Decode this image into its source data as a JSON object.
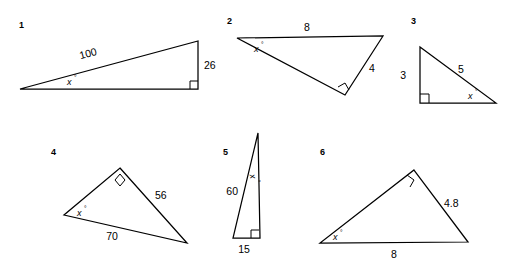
{
  "worksheet": {
    "title": "Right triangle trigonometry figures",
    "background_color": "#ffffff",
    "ink_color": "#000000"
  },
  "figures": [
    {
      "number": "1",
      "angle_label": "x",
      "degree_symbol": "°",
      "sides": [
        {
          "label": "100",
          "position": "hypotenuse"
        },
        {
          "label": "26",
          "position": "opposite-vertical"
        }
      ],
      "right_angle": true
    },
    {
      "number": "2",
      "angle_label": "x",
      "degree_symbol": "°",
      "sides": [
        {
          "label": "8",
          "position": "top"
        },
        {
          "label": "4",
          "position": "right"
        }
      ],
      "right_angle": true
    },
    {
      "number": "3",
      "angle_label": "x",
      "degree_symbol": "°",
      "sides": [
        {
          "label": "3",
          "position": "left-vertical"
        },
        {
          "label": "5",
          "position": "hypotenuse"
        }
      ],
      "right_angle": true
    },
    {
      "number": "4",
      "angle_label": "x",
      "degree_symbol": "°",
      "sides": [
        {
          "label": "56",
          "position": "right"
        },
        {
          "label": "70",
          "position": "bottom"
        }
      ],
      "right_angle": true
    },
    {
      "number": "5",
      "angle_label": "x",
      "degree_symbol": "°",
      "sides": [
        {
          "label": "60",
          "position": "hypotenuse"
        },
        {
          "label": "15",
          "position": "bottom"
        }
      ],
      "right_angle": true
    },
    {
      "number": "6",
      "angle_label": "x",
      "degree_symbol": "°",
      "sides": [
        {
          "label": "4.8",
          "position": "right"
        },
        {
          "label": "8",
          "position": "bottom"
        }
      ],
      "right_angle": true
    }
  ]
}
